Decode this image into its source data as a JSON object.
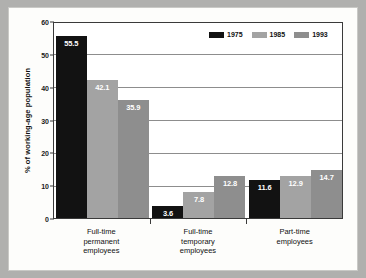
{
  "chart_data": {
    "type": "bar",
    "title": "",
    "xlabel": "",
    "ylabel": "% of working-age population",
    "ylim": [
      0,
      60
    ],
    "yticks": [
      0,
      10,
      20,
      30,
      40,
      50,
      60
    ],
    "grid": true,
    "legend_position": "top-right",
    "categories": [
      "Full-time\npermanent\nemployees",
      "Full-time\ntemporary\nemployees",
      "Part-time\nemployees"
    ],
    "series": [
      {
        "name": "1975",
        "color": "#121212",
        "values": [
          55.5,
          3.6,
          11.6
        ]
      },
      {
        "name": "1985",
        "color": "#a3a3a3",
        "values": [
          42.1,
          7.8,
          12.9
        ]
      },
      {
        "name": "1993",
        "color": "#8e8e8e",
        "values": [
          35.9,
          12.8,
          14.7
        ]
      }
    ],
    "data_labels": [
      [
        "55.5",
        "42.1",
        "35.9"
      ],
      [
        "3.6",
        "7.8",
        "12.8"
      ],
      [
        "11.6",
        "12.9",
        "14.7"
      ]
    ],
    "ytick_labels": [
      "0",
      "10",
      "20",
      "30",
      "40",
      "50",
      "60"
    ]
  },
  "colors": {
    "page_background": "#b0b0ae",
    "card_background": "#fdfdfb",
    "axis": "#3a3a3a",
    "gridline": "#8d8d8d",
    "label_text": "#111111",
    "bar_label_text": "#ffffff"
  }
}
